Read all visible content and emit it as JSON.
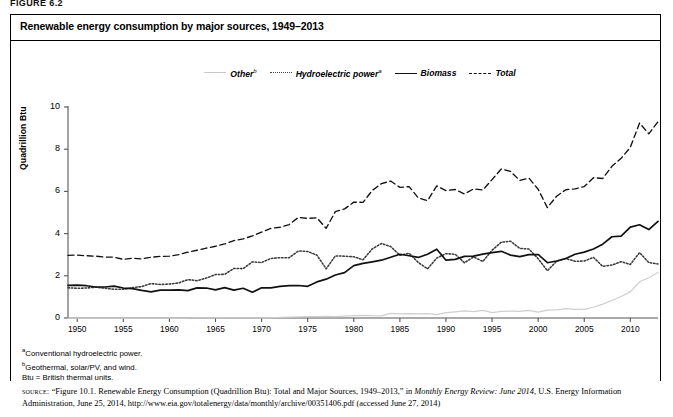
{
  "figure_label": "FIGURE 6.2",
  "box_title": "Renewable energy consumption by major sources, 1949–2013",
  "legend": {
    "items": [
      {
        "label": "Other",
        "sup": "b",
        "style": "thin-solid-gray",
        "color": "#c9c9c9"
      },
      {
        "label": "Hydroelectric power",
        "sup": "a",
        "style": "dotted",
        "color": "#444444"
      },
      {
        "label": "Biomass",
        "sup": "",
        "style": "solid",
        "color": "#111111"
      },
      {
        "label": "Total",
        "sup": "",
        "style": "dashed",
        "color": "#111111"
      }
    ]
  },
  "axes": {
    "ylabel": "Quadrillion Btu",
    "yticks": [
      "0",
      "2",
      "4",
      "6",
      "8",
      "10"
    ],
    "xticks": [
      "1950",
      "1955",
      "1960",
      "1965",
      "1970",
      "1975",
      "1980",
      "1985",
      "1990",
      "1995",
      "2000",
      "2005",
      "2010"
    ]
  },
  "notes": [
    {
      "sup": "a",
      "text": "Conventional hydroelectric power."
    },
    {
      "sup": "b",
      "text": "Geothermal, solar/PV, and wind."
    },
    {
      "sup": "",
      "text": "Btu = British thermal units."
    }
  ],
  "source": {
    "prefix": "source:",
    "part1": " “Figure 10.1. Renewable Energy Consumption (Quadrillion Btu): Total and Major Sources, 1949–2013,” in ",
    "italic": "Monthly Energy Review: June 2014",
    "part2": ", U.S. Energy Information Administration, June 25, 2014, http://www.eia.gov/totalenergy/data/monthly/archive/00351406.pdf (accessed June 27, 2014)"
  },
  "chart_data": {
    "type": "line",
    "title": "Renewable energy consumption by major sources, 1949–2013",
    "xlabel": "",
    "ylabel": "Quadrillion Btu",
    "xlim": [
      1949,
      2013
    ],
    "ylim": [
      0,
      10
    ],
    "grid": false,
    "legend_position": "top-center",
    "x": [
      1949,
      1950,
      1951,
      1952,
      1953,
      1954,
      1955,
      1956,
      1957,
      1958,
      1959,
      1960,
      1961,
      1962,
      1963,
      1964,
      1965,
      1966,
      1967,
      1968,
      1969,
      1970,
      1971,
      1972,
      1973,
      1974,
      1975,
      1976,
      1977,
      1978,
      1979,
      1980,
      1981,
      1982,
      1983,
      1984,
      1985,
      1986,
      1987,
      1988,
      1989,
      1990,
      1991,
      1992,
      1993,
      1994,
      1995,
      1996,
      1997,
      1998,
      1999,
      2000,
      2001,
      2002,
      2003,
      2004,
      2005,
      2006,
      2007,
      2008,
      2009,
      2010,
      2011,
      2012,
      2013
    ],
    "series": [
      {
        "name": "Total",
        "style": "dashed",
        "color": "#111111",
        "values": [
          2.97,
          2.98,
          2.95,
          2.93,
          2.89,
          2.88,
          2.78,
          2.83,
          2.8,
          2.88,
          2.92,
          2.93,
          3.0,
          3.12,
          3.21,
          3.31,
          3.4,
          3.51,
          3.67,
          3.75,
          3.89,
          4.07,
          4.25,
          4.3,
          4.43,
          4.77,
          4.72,
          4.75,
          4.25,
          5.04,
          5.17,
          5.49,
          5.48,
          6.04,
          6.37,
          6.49,
          6.19,
          6.23,
          5.69,
          5.56,
          6.26,
          6.04,
          6.09,
          5.88,
          6.12,
          6.07,
          6.56,
          7.06,
          6.95,
          6.52,
          6.63,
          6.1,
          5.23,
          5.77,
          6.08,
          6.12,
          6.23,
          6.65,
          6.61,
          7.19,
          7.57,
          8.09,
          9.24,
          8.73,
          9.3
        ]
      },
      {
        "name": "Hydroelectric power",
        "style": "dotted",
        "color": "#444444",
        "values": [
          1.43,
          1.41,
          1.42,
          1.46,
          1.41,
          1.36,
          1.36,
          1.44,
          1.49,
          1.63,
          1.59,
          1.61,
          1.66,
          1.82,
          1.77,
          1.89,
          2.06,
          2.07,
          2.35,
          2.34,
          2.66,
          2.63,
          2.82,
          2.86,
          2.86,
          3.18,
          3.15,
          2.98,
          2.33,
          2.94,
          2.93,
          2.9,
          2.76,
          3.27,
          3.53,
          3.39,
          2.97,
          3.07,
          2.63,
          2.33,
          2.84,
          3.05,
          3.02,
          2.62,
          2.89,
          2.68,
          3.21,
          3.59,
          3.64,
          3.3,
          3.27,
          2.81,
          2.24,
          2.69,
          2.82,
          2.69,
          2.7,
          2.87,
          2.45,
          2.51,
          2.67,
          2.54,
          3.1,
          2.63,
          2.56
        ]
      },
      {
        "name": "Biomass",
        "style": "solid",
        "color": "#111111",
        "values": [
          1.55,
          1.56,
          1.53,
          1.47,
          1.47,
          1.51,
          1.42,
          1.39,
          1.31,
          1.24,
          1.32,
          1.32,
          1.33,
          1.3,
          1.43,
          1.42,
          1.33,
          1.44,
          1.32,
          1.41,
          1.22,
          1.43,
          1.43,
          1.5,
          1.53,
          1.54,
          1.5,
          1.71,
          1.84,
          2.04,
          2.15,
          2.48,
          2.59,
          2.66,
          2.74,
          2.88,
          3.02,
          2.95,
          2.87,
          3.02,
          3.26,
          2.74,
          2.78,
          2.92,
          2.93,
          3.03,
          3.1,
          3.16,
          2.98,
          2.91,
          3.0,
          3.01,
          2.62,
          2.7,
          2.82,
          3.02,
          3.12,
          3.27,
          3.5,
          3.85,
          3.88,
          4.31,
          4.42,
          4.19,
          4.58
        ]
      },
      {
        "name": "Other",
        "style": "thin-solid-gray",
        "color": "#c9c9c9",
        "values": [
          0.0,
          0.0,
          0.0,
          0.0,
          0.0,
          0.0,
          0.0,
          0.0,
          0.0,
          0.0,
          0.0,
          0.0,
          0.0,
          0.0,
          0.01,
          0.01,
          0.01,
          0.01,
          0.01,
          0.01,
          0.01,
          0.01,
          0.01,
          0.03,
          0.04,
          0.05,
          0.07,
          0.06,
          0.08,
          0.06,
          0.09,
          0.11,
          0.13,
          0.11,
          0.1,
          0.22,
          0.2,
          0.21,
          0.19,
          0.21,
          0.16,
          0.25,
          0.29,
          0.34,
          0.3,
          0.36,
          0.25,
          0.31,
          0.33,
          0.31,
          0.36,
          0.28,
          0.37,
          0.38,
          0.44,
          0.41,
          0.41,
          0.51,
          0.66,
          0.83,
          1.02,
          1.24,
          1.72,
          1.91,
          2.16
        ]
      }
    ]
  }
}
